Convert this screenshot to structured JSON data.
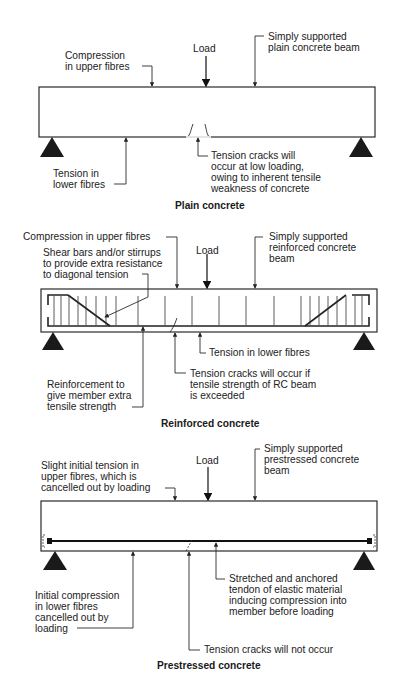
{
  "figure": {
    "panels": [
      {
        "id": "plain",
        "title": "Plain concrete",
        "load_label": "Load",
        "labels": {
          "compression_l1": "Compression",
          "compression_l2": "in upper fibres",
          "beam_l1": "Simply supported",
          "beam_l2": "plain concrete beam",
          "tension_l1": "Tension in",
          "tension_l2": "lower fibres",
          "cracks_l1": "Tension cracks will",
          "cracks_l2": "occur at low loading,",
          "cracks_l3": "owing to inherent tensile",
          "cracks_l4": "weakness of concrete"
        }
      },
      {
        "id": "reinforced",
        "title": "Reinforced concrete",
        "load_label": "Load",
        "labels": {
          "compression": "Compression in upper fibres",
          "shear_l1": "Shear bars and/or stirrups",
          "shear_l2": "to provide extra resistance",
          "shear_l3": "to diagonal tension",
          "beam_l1": "Simply supported",
          "beam_l2": "reinforced concrete",
          "beam_l3": "beam",
          "tension": "Tension in lower fibres",
          "reinf_l1": "Reinforcement to",
          "reinf_l2": "give member extra",
          "reinf_l3": "tensile strength",
          "cracks_l1": "Tension cracks will occur if",
          "cracks_l2": "tensile strength of RC beam",
          "cracks_l3": "is exceeded"
        }
      },
      {
        "id": "prestressed",
        "title": "Prestressed concrete",
        "load_label": "Load",
        "labels": {
          "slight_l1": "Slight initial tension in",
          "slight_l2": "upper fibres, which is",
          "slight_l3": "cancelled out by loading",
          "beam_l1": "Simply supported",
          "beam_l2": "prestressed concrete",
          "beam_l3": "beam",
          "tendon_l1": "Stretched and anchored",
          "tendon_l2": "tendon of elastic material",
          "tendon_l3": "inducing compression into",
          "tendon_l4": "member before loading",
          "init_l1": "Initial compression",
          "init_l2": "in lower fibres",
          "init_l3": "cancelled out by",
          "init_l4": "loading",
          "nocrack": "Tension cracks will not occur"
        }
      }
    ]
  }
}
